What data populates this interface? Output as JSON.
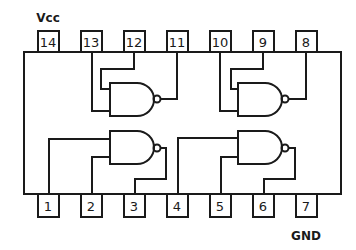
{
  "diagram": {
    "type": "IC pinout - quad 2-input NAND gate",
    "labels": {
      "vcc": "Vcc",
      "gnd": "GND"
    },
    "top_pins": [
      {
        "num": "14",
        "x": 48
      },
      {
        "num": "13",
        "x": 91
      },
      {
        "num": "12",
        "x": 134
      },
      {
        "num": "11",
        "x": 177
      },
      {
        "num": "10",
        "x": 220
      },
      {
        "num": "9",
        "x": 263
      },
      {
        "num": "8",
        "x": 306
      }
    ],
    "bottom_pins": [
      {
        "num": "1",
        "x": 48
      },
      {
        "num": "2",
        "x": 91
      },
      {
        "num": "3",
        "x": 134
      },
      {
        "num": "4",
        "x": 177
      },
      {
        "num": "5",
        "x": 220
      },
      {
        "num": "6",
        "x": 263
      },
      {
        "num": "7",
        "x": 306
      }
    ],
    "gates": [
      {
        "id": "gate-1",
        "inputs": [
          "1",
          "2"
        ],
        "output": "3"
      },
      {
        "id": "gate-2",
        "inputs": [
          "4",
          "5"
        ],
        "output": "6"
      },
      {
        "id": "gate-3",
        "inputs": [
          "13",
          "12"
        ],
        "output": "11"
      },
      {
        "id": "gate-4",
        "inputs": [
          "10",
          "9"
        ],
        "output": "8"
      }
    ],
    "colors": {
      "line": "#1a1a1a",
      "background": "#ffffff"
    }
  }
}
